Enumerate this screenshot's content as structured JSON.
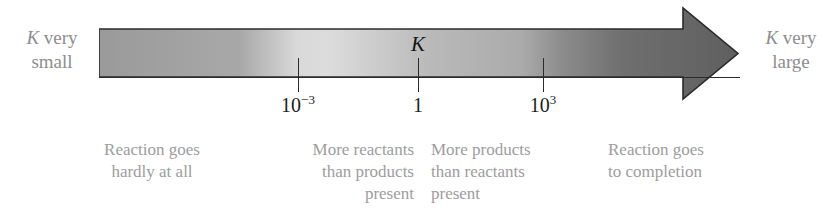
{
  "figure": {
    "type": "equilibrium-constant-scale"
  },
  "endpoints": {
    "left": {
      "symbol": "K",
      "text": "very",
      "text2": "small"
    },
    "right": {
      "symbol": "K",
      "text": "very",
      "text2": "large"
    }
  },
  "marker": {
    "symbol": "K"
  },
  "chart_data": {
    "type": "scale",
    "orientation": "horizontal-arrow",
    "axis_variable": "K",
    "tick_labels": [
      "10⁻³",
      "1",
      "10³"
    ],
    "ticks": [
      {
        "base": "10",
        "exponent": "−3",
        "x": 298
      },
      {
        "base": "1",
        "exponent": "",
        "x": 418
      },
      {
        "base": "10",
        "exponent": "3",
        "x": 543
      }
    ],
    "left_end_label": "K very small",
    "right_end_label": "K very large",
    "regions": [
      {
        "label": "Reaction goes hardly at all",
        "lines": [
          "Reaction goes",
          "hardly at all"
        ],
        "align": "center"
      },
      {
        "label": "More reactants than products present",
        "lines": [
          "More reactants",
          "than products",
          "present"
        ],
        "align": "right"
      },
      {
        "label": "More products than reactants present",
        "lines": [
          "More products",
          "than reactants",
          "present"
        ],
        "align": "left"
      },
      {
        "label": "Reaction goes to completion",
        "lines": [
          "Reaction goes",
          "to completion"
        ],
        "align": "left"
      }
    ],
    "gradient_stops": [
      {
        "offset": 0.0,
        "color": "#9a9a9a"
      },
      {
        "offset": 0.22,
        "color": "#a8a8a8"
      },
      {
        "offset": 0.31,
        "color": "#d9d9d9"
      },
      {
        "offset": 0.36,
        "color": "#dcdcdc"
      },
      {
        "offset": 0.52,
        "color": "#b9b9b9"
      },
      {
        "offset": 0.66,
        "color": "#ababab"
      },
      {
        "offset": 0.73,
        "color": "#8a8a8a"
      },
      {
        "offset": 0.82,
        "color": "#6f6f6f"
      },
      {
        "offset": 1.0,
        "color": "#5f5f5f"
      }
    ],
    "colors": {
      "outline": "#2b2b2b",
      "tick": "#2b2b2b",
      "caption_text": "#9d9d9d",
      "end_label_text": "#8e8e8e",
      "tick_label_text": "#1d1d1d",
      "background": "#ffffff"
    }
  }
}
